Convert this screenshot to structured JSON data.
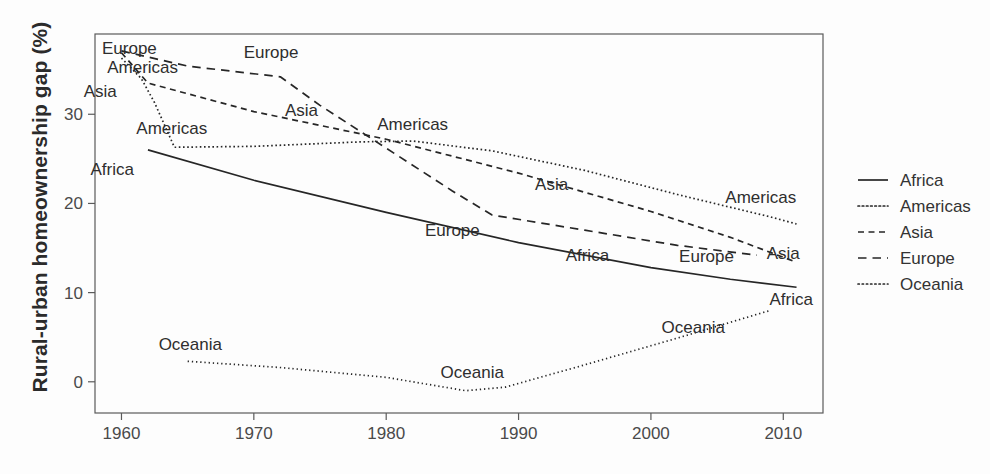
{
  "chart_data": {
    "type": "line",
    "title": "",
    "xlabel": "",
    "ylabel": "Rural-urban homeownership gap (%)",
    "xlim": [
      1958,
      2013
    ],
    "ylim": [
      -3.5,
      39
    ],
    "xticks": [
      1960,
      1970,
      1980,
      1990,
      2000,
      2010
    ],
    "yticks": [
      0,
      10,
      20,
      30
    ],
    "xtick_labels": [
      "1960",
      "1970",
      "1980",
      "1990",
      "2000",
      "2010"
    ],
    "ytick_labels": [
      "0",
      "10",
      "20",
      "30"
    ],
    "grid": false,
    "legend_position": "right",
    "series": [
      {
        "name": "Africa",
        "dash": "solid",
        "inline_labels": [
          {
            "text": "Africa",
            "x": 1959.3,
            "y": 23.2
          },
          {
            "text": "Africa",
            "x": 1995.2,
            "y": 13.6
          },
          {
            "text": "Africa",
            "x": 2010.6,
            "y": 8.6
          }
        ],
        "points": [
          {
            "x": 1962.0,
            "y": 26.0
          },
          {
            "x": 1970.0,
            "y": 22.6
          },
          {
            "x": 1980.0,
            "y": 19.0
          },
          {
            "x": 1990.0,
            "y": 15.6
          },
          {
            "x": 2000.0,
            "y": 12.8
          },
          {
            "x": 2006.0,
            "y": 11.5
          },
          {
            "x": 2011.0,
            "y": 10.6
          }
        ]
      },
      {
        "name": "Americas",
        "dash": "dotted",
        "inline_labels": [
          {
            "text": "Americas",
            "x": 1961.6,
            "y": 34.6
          },
          {
            "text": "Americas",
            "x": 1963.8,
            "y": 27.8
          },
          {
            "text": "Americas",
            "x": 1982.0,
            "y": 28.2
          },
          {
            "text": "Americas",
            "x": 2008.3,
            "y": 20.0
          }
        ],
        "points": [
          {
            "x": 1960.0,
            "y": 36.3
          },
          {
            "x": 1961.5,
            "y": 34.0
          },
          {
            "x": 1962.5,
            "y": 31.3
          },
          {
            "x": 1964.0,
            "y": 26.3
          },
          {
            "x": 1970.0,
            "y": 26.4
          },
          {
            "x": 1978.0,
            "y": 26.9
          },
          {
            "x": 1982.0,
            "y": 27.0
          },
          {
            "x": 1988.0,
            "y": 25.9
          },
          {
            "x": 1995.0,
            "y": 23.7
          },
          {
            "x": 2002.0,
            "y": 21.0
          },
          {
            "x": 2009.0,
            "y": 18.5
          },
          {
            "x": 2011.0,
            "y": 17.7
          }
        ]
      },
      {
        "name": "Asia",
        "dash": "dashed",
        "inline_labels": [
          {
            "text": "Asia",
            "x": 1958.4,
            "y": 31.9
          },
          {
            "text": "Asia",
            "x": 1973.6,
            "y": 29.8
          },
          {
            "text": "Asia",
            "x": 1992.5,
            "y": 21.5
          },
          {
            "text": "Asia",
            "x": 2010.0,
            "y": 13.8
          }
        ],
        "points": [
          {
            "x": 1960.0,
            "y": 36.9
          },
          {
            "x": 1962.0,
            "y": 33.5
          },
          {
            "x": 1970.0,
            "y": 30.3
          },
          {
            "x": 1980.0,
            "y": 27.2
          },
          {
            "x": 1990.0,
            "y": 23.4
          },
          {
            "x": 2000.0,
            "y": 19.1
          },
          {
            "x": 2006.0,
            "y": 16.2
          },
          {
            "x": 2011.0,
            "y": 13.4
          }
        ]
      },
      {
        "name": "Europe",
        "dash": "dashed-long",
        "inline_labels": [
          {
            "text": "Europe",
            "x": 1960.6,
            "y": 36.8
          },
          {
            "text": "Europe",
            "x": 1971.3,
            "y": 36.3
          },
          {
            "text": "Europe",
            "x": 1985.0,
            "y": 16.4
          },
          {
            "text": "Europe",
            "x": 2004.2,
            "y": 13.4
          }
        ],
        "points": [
          {
            "x": 1960.0,
            "y": 37.1
          },
          {
            "x": 1965.0,
            "y": 35.4
          },
          {
            "x": 1972.0,
            "y": 34.2
          },
          {
            "x": 1975.0,
            "y": 31.0
          },
          {
            "x": 1980.0,
            "y": 26.2
          },
          {
            "x": 1985.0,
            "y": 21.4
          },
          {
            "x": 1988.0,
            "y": 18.7
          },
          {
            "x": 1995.0,
            "y": 17.0
          },
          {
            "x": 2002.0,
            "y": 15.3
          },
          {
            "x": 2008.0,
            "y": 14.2
          }
        ]
      },
      {
        "name": "Oceania",
        "dash": "fine-dotted",
        "inline_labels": [
          {
            "text": "Oceania",
            "x": 1965.2,
            "y": 3.6
          },
          {
            "text": "Oceania",
            "x": 1986.5,
            "y": 0.4
          },
          {
            "text": "Oceania",
            "x": 2003.2,
            "y": 5.5
          }
        ],
        "points": [
          {
            "x": 1965.0,
            "y": 2.3
          },
          {
            "x": 1972.0,
            "y": 1.6
          },
          {
            "x": 1980.0,
            "y": 0.5
          },
          {
            "x": 1986.0,
            "y": -1.0
          },
          {
            "x": 1989.0,
            "y": -0.6
          },
          {
            "x": 1995.0,
            "y": 1.9
          },
          {
            "x": 2002.0,
            "y": 4.9
          },
          {
            "x": 2009.0,
            "y": 8.0
          }
        ]
      }
    ]
  },
  "legend": {
    "items": [
      {
        "label": "Africa",
        "dash": "solid"
      },
      {
        "label": "Americas",
        "dash": "dotted"
      },
      {
        "label": "Asia",
        "dash": "dashed"
      },
      {
        "label": "Europe",
        "dash": "dashed-long"
      },
      {
        "label": "Oceania",
        "dash": "fine-dotted"
      }
    ]
  },
  "colors": {
    "line": "#262626",
    "frame": "#5a5a5a",
    "text": "#333333",
    "background": "#fdfdfd"
  }
}
